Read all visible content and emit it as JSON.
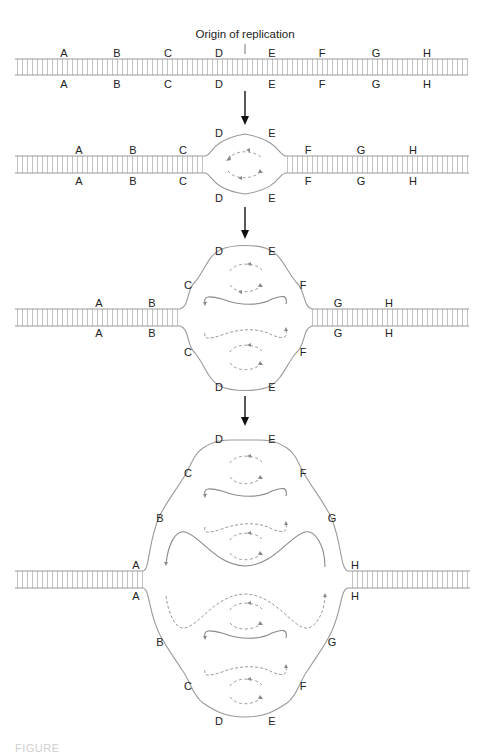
{
  "figure": {
    "origin_label": "Origin of replication",
    "caption_partial": "FIGURE",
    "colors": {
      "parental_strand": "#9a9a9a",
      "base_pair_rungs": "#b3b3b3",
      "new_strand": "#8a8a8a",
      "labels": "#222222",
      "step_arrows": "#111111"
    },
    "stages": [
      {
        "id": 1,
        "description": "Intact double helix with origin between D and E",
        "top_labels": [
          "A",
          "B",
          "C",
          "D",
          "E",
          "F",
          "G",
          "H"
        ],
        "bottom_labels": [
          "A",
          "B",
          "C",
          "D",
          "E",
          "F",
          "G",
          "H"
        ]
      },
      {
        "id": 2,
        "description": "Replication bubble opens at origin (D-E)",
        "top_labels": [
          "A",
          "B",
          "C",
          "D",
          "E",
          "F",
          "G",
          "H"
        ],
        "bottom_labels": [
          "A",
          "B",
          "C",
          "D",
          "E",
          "F",
          "G",
          "H"
        ]
      },
      {
        "id": 3,
        "description": "Bubble expands to C-F; new strands synthesized",
        "top_labels": [
          "A",
          "B",
          "C",
          "D",
          "E",
          "F",
          "G",
          "H"
        ],
        "bottom_labels": [
          "A",
          "B",
          "C",
          "D",
          "E",
          "F",
          "G",
          "H"
        ]
      },
      {
        "id": 4,
        "description": "Bubble expands to A-H; bidirectional forks",
        "top_labels": [
          "A",
          "B",
          "C",
          "D",
          "E",
          "F",
          "G",
          "H"
        ],
        "bottom_labels": [
          "A",
          "B",
          "C",
          "D",
          "E",
          "F",
          "G",
          "H"
        ]
      }
    ],
    "step_arrows": 3
  }
}
